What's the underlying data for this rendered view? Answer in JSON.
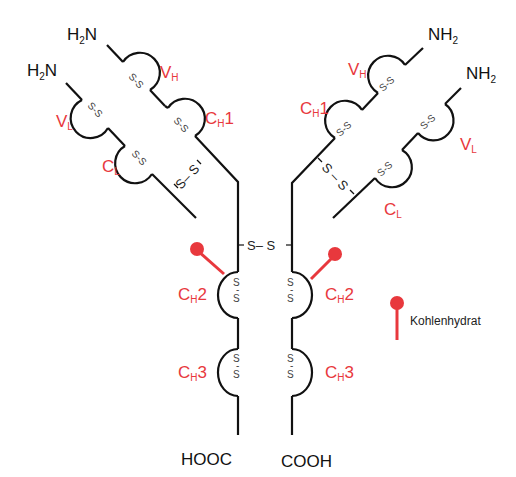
{
  "diagram": {
    "colors": {
      "line": "#111111",
      "accent": "#e8383d",
      "disulfide": "#444444"
    },
    "termini": {
      "left_heavy_n": {
        "main": "H",
        "sub": "2",
        "tail": "N"
      },
      "left_light_n": {
        "main": "H",
        "sub": "2",
        "tail": "N"
      },
      "right_heavy_n": {
        "main": "NH",
        "sub": "2"
      },
      "right_light_n": {
        "main": "NH",
        "sub": "2"
      },
      "left_c": "HOOC",
      "right_c": "COOH"
    },
    "domains": {
      "vh": {
        "main": "V",
        "sub": "H",
        "tail": ""
      },
      "ch1": {
        "main": "C",
        "sub": "H",
        "tail": "1"
      },
      "vl": {
        "main": "V",
        "sub": "L",
        "tail": ""
      },
      "cl": {
        "main": "C",
        "sub": "L",
        "tail": ""
      },
      "ch2": {
        "main": "C",
        "sub": "H",
        "tail": "2"
      },
      "ch3": {
        "main": "C",
        "sub": "H",
        "tail": "3"
      }
    },
    "disulfide": {
      "intra": "S-S",
      "inter": "S–S",
      "hinge": "S– S",
      "s": "S",
      "dash": "-"
    },
    "legend": {
      "carbohydrate_label": "Kohlenhydrat",
      "icon": "carbohydrate-pin-icon"
    }
  }
}
